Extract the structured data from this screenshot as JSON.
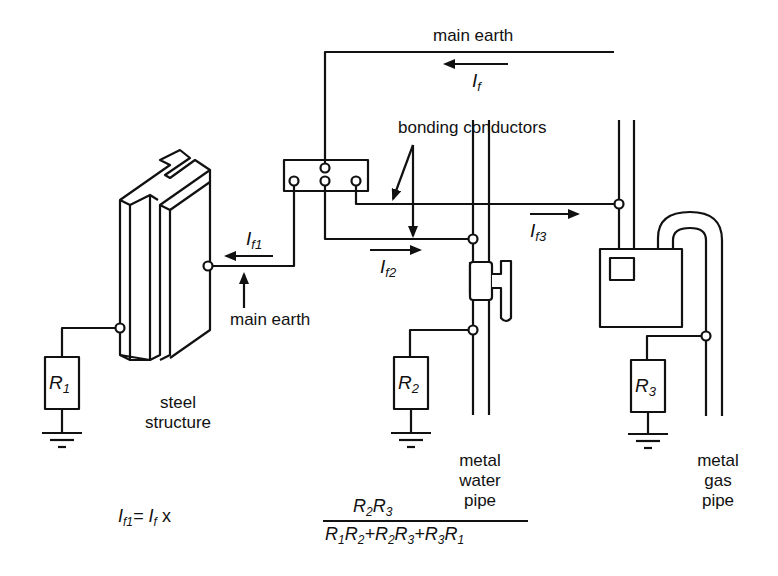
{
  "labels": {
    "main_earth_top": "main earth",
    "main_earth_left": "main earth",
    "bonding_conductors": "bonding conductors",
    "steel_structure": [
      "steel",
      "structure"
    ],
    "water_pipe": [
      "metal",
      "water",
      "pipe"
    ],
    "gas_pipe": [
      "metal",
      "gas",
      "pipe"
    ]
  },
  "currents": {
    "If": {
      "base": "I",
      "sub": "f"
    },
    "If1": {
      "base": "I",
      "sub": "f1"
    },
    "If2": {
      "base": "I",
      "sub": "f2"
    },
    "If3": {
      "base": "I",
      "sub": "f3"
    }
  },
  "resistors": {
    "R1": {
      "base": "R",
      "sub": "1"
    },
    "R2": {
      "base": "R",
      "sub": "2"
    },
    "R3": {
      "base": "R",
      "sub": "3"
    }
  },
  "formula": {
    "lhs": "If1 = If x",
    "numerator": "R2R3",
    "denominator": "R1R2+R2R3+R3R1"
  },
  "colors": {
    "line": "#111111",
    "background": "#ffffff"
  }
}
